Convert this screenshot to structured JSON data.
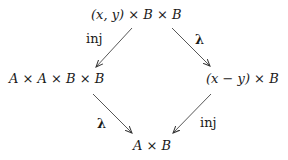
{
  "diagram": {
    "type": "commutative-diagram",
    "nodes": {
      "top": "(x, y) × B × B",
      "left": "A × A × B × B",
      "right": "(x − y) × B",
      "bottom": "A × B"
    },
    "edges": [
      {
        "from": "top",
        "to": "left",
        "label": "inj"
      },
      {
        "from": "top",
        "to": "right",
        "label": "λ"
      },
      {
        "from": "left",
        "to": "bottom",
        "label": "λ"
      },
      {
        "from": "right",
        "to": "bottom",
        "label": "inj"
      }
    ],
    "colors": {
      "ink": "#1a1a1a",
      "background": "#ffffff"
    }
  }
}
